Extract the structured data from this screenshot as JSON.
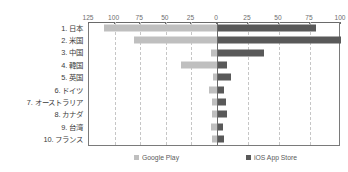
{
  "chart_data": {
    "type": "bar",
    "subtype": "butterfly-tornado-horizontal",
    "title": "",
    "xlabel": "",
    "ylabel": "",
    "grid": true,
    "legend_position": "bottom",
    "categories": [
      "1. 日本",
      "2. 米国",
      "3. 中国",
      "4. 韓国",
      "5. 英国",
      "6. ドイツ",
      "7. オーストラリア",
      "8. カナダ",
      "9. 台湾",
      "10. フランス"
    ],
    "series": [
      {
        "name": "Google Play",
        "side": "left",
        "color": "#bfbfbf",
        "axis_ticks": [
          125,
          100,
          75,
          50,
          25,
          0
        ],
        "axis_max": 125,
        "values": [
          110,
          81,
          6,
          35,
          4,
          8,
          5,
          5,
          6,
          5
        ]
      },
      {
        "name": "iOS App Store",
        "side": "right",
        "color": "#595959",
        "axis_ticks": [
          0,
          25,
          50,
          75,
          100
        ],
        "axis_max": 100,
        "values": [
          80,
          100,
          38,
          8,
          11,
          6,
          7,
          8,
          5,
          6
        ]
      }
    ],
    "axis_tick_labels": [
      "125",
      "100",
      "75",
      "50",
      "25",
      "0",
      "25",
      "50",
      "75",
      "100"
    ]
  },
  "legend": {
    "google_play": "Google Play",
    "ios_app_store": "iOS App Store"
  },
  "colors": {
    "google_play": "#bfbfbf",
    "ios_app_store": "#595959",
    "axis": "#6a6a6a",
    "grid": "#c6c6c6",
    "text": "#3a3a3a"
  }
}
